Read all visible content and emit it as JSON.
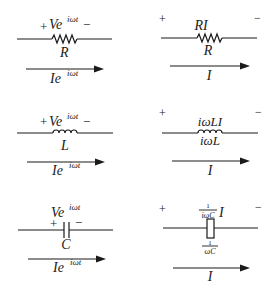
{
  "diagram": {
    "panels": [
      {
        "id": "resistor-time",
        "component": "resistor",
        "voltage_label": {
          "plus": "+",
          "base": "Ve",
          "exp": "iωt",
          "minus": "−"
        },
        "element_label": "R",
        "current_label": {
          "base": "Ie",
          "exp": "iωt"
        }
      },
      {
        "id": "resistor-phasor",
        "component": "resistor",
        "plus": "+",
        "minus": "−",
        "voltage_label": "RI",
        "element_label": "R",
        "current_label": "I"
      },
      {
        "id": "inductor-time",
        "component": "inductor",
        "voltage_label": {
          "plus": "+",
          "base": "Ve",
          "exp": "iωt",
          "minus": "−"
        },
        "element_label": "L",
        "current_label": {
          "base": "Ie",
          "exp": "iωt"
        }
      },
      {
        "id": "inductor-phasor",
        "component": "inductor",
        "plus": "+",
        "minus": "−",
        "voltage_label": "iωLI",
        "element_label": "iωL",
        "current_label": "I"
      },
      {
        "id": "capacitor-time",
        "component": "capacitor",
        "voltage_label": {
          "base": "Ve",
          "exp": "iωt",
          "plus": "+",
          "minus": "−"
        },
        "element_label": "C",
        "current_label": {
          "base": "Ie",
          "exp": "iωt"
        }
      },
      {
        "id": "capacitor-phasor",
        "component": "impedance-box",
        "plus": "+",
        "minus": "−",
        "voltage_label": {
          "num": "1",
          "den": "iωC",
          "suffix": "I"
        },
        "element_label": {
          "num": "1",
          "den": "ωC"
        },
        "current_label": "I"
      }
    ]
  }
}
